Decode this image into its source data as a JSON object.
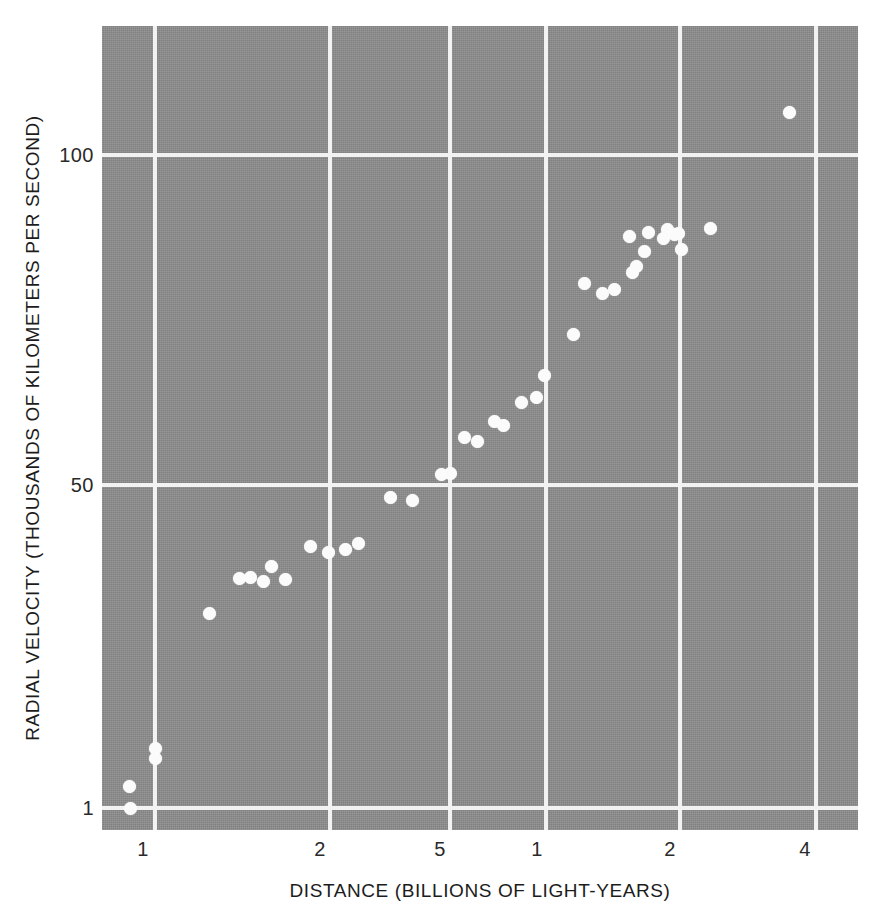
{
  "figure": {
    "background_color": "#ffffff",
    "plot_background_color": "#8b8b8b",
    "grid_color": "#f2f2f2",
    "point_color": "#fbfbfb"
  },
  "axes": {
    "x_title": "DISTANCE (BILLIONS OF LIGHT-YEARS)",
    "y_title": "RADIAL VELOCITY (THOUSANDS OF KILOMETERS PER SECOND)",
    "x_ticks": [
      {
        "label": "1",
        "px": 143
      },
      {
        "label": "2",
        "px": 320
      },
      {
        "label": "5",
        "px": 440
      },
      {
        "label": "1",
        "px": 537
      },
      {
        "label": "2",
        "px": 670
      },
      {
        "label": "4",
        "px": 805
      }
    ],
    "y_ticks": [
      {
        "label": "100",
        "px": 155
      },
      {
        "label": "50",
        "px": 485
      },
      {
        "label": "1",
        "px": 808
      }
    ],
    "x_gridlines_px": [
      155,
      330,
      450,
      546,
      680,
      816
    ],
    "y_gridlines_px": [
      155,
      485,
      808
    ]
  },
  "chart_data": {
    "type": "scatter",
    "title": "",
    "xlabel": "DISTANCE (BILLIONS OF LIGHT-YEARS)",
    "ylabel": "RADIAL VELOCITY (THOUSANDS OF KILOMETERS PER SECOND)",
    "xscale": "log",
    "yscale": "log",
    "grid": true,
    "legend": "none",
    "xtick_labels": [
      "1",
      "2",
      "5",
      "1",
      "2",
      "4"
    ],
    "ytick_labels": [
      "100",
      "50",
      "1"
    ],
    "n_points": 36,
    "x_unit": "billions of light-years",
    "y_unit": "thousands of kilometers per second",
    "points_px": [
      [
        129,
        786
      ],
      [
        130,
        808
      ],
      [
        155,
        748
      ],
      [
        155,
        758
      ],
      [
        209,
        613
      ],
      [
        239,
        578
      ],
      [
        250,
        577
      ],
      [
        263,
        581
      ],
      [
        271,
        566
      ],
      [
        285,
        579
      ],
      [
        310,
        546
      ],
      [
        328,
        552
      ],
      [
        345,
        549
      ],
      [
        358,
        543
      ],
      [
        390,
        497
      ],
      [
        412,
        500
      ],
      [
        441,
        474
      ],
      [
        450,
        473
      ],
      [
        464,
        437
      ],
      [
        477,
        441
      ],
      [
        494,
        421
      ],
      [
        503,
        425
      ],
      [
        521,
        402
      ],
      [
        536,
        397
      ],
      [
        544,
        375
      ],
      [
        573,
        334
      ],
      [
        584,
        283
      ],
      [
        602,
        293
      ],
      [
        614,
        289
      ],
      [
        629,
        236
      ],
      [
        632,
        272
      ],
      [
        636,
        266
      ],
      [
        644,
        251
      ],
      [
        648,
        232
      ],
      [
        663,
        238
      ],
      [
        667,
        229
      ],
      [
        674,
        234
      ],
      [
        678,
        233
      ],
      [
        681,
        249
      ],
      [
        710,
        228
      ],
      [
        789,
        112
      ]
    ]
  }
}
